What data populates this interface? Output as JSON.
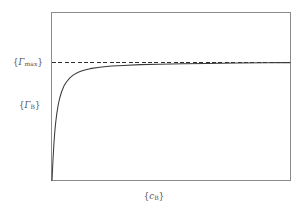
{
  "figure": {
    "name": "langmuir-adsorption-isotherm",
    "background_color": "#ffffff",
    "frame_color": "#8b8b8b",
    "curve_color": "#3a3a3a",
    "dashed_color": "#2e2e2e",
    "text_color": "#4f4f4f"
  },
  "labels": {
    "y_asymptote": "{Γmax}",
    "y_asymptote_open": "{",
    "y_asymptote_symbol": "Γ",
    "y_asymptote_sub": "max",
    "y_asymptote_close": "}",
    "y_axis": "{ΓB}",
    "y_axis_open": "{",
    "y_axis_symbol": "Γ",
    "y_axis_sub": "B",
    "y_axis_close": "}",
    "x_axis": "{cB}",
    "x_axis_open": "{",
    "x_axis_symbol": "c",
    "x_axis_sub": "B",
    "x_axis_close": "}"
  },
  "chart_data": {
    "type": "line",
    "title": "",
    "xlabel": "{c_B}",
    "ylabel": "{Γ_B}",
    "grid": false,
    "legend": false,
    "xlim": [
      0,
      1
    ],
    "ylim": [
      0,
      1.12
    ],
    "annotations": [
      {
        "name": "gamma-max-asymptote",
        "type": "horizontal-dashed-line",
        "y": 1.0,
        "label": "{Γmax}",
        "style": "dashed",
        "color": "#2e2e2e"
      }
    ],
    "series": [
      {
        "name": "langmuir-isotherm",
        "style": "solid",
        "color": "#3a3a3a",
        "description": "Gamma_B = Gamma_max * K*c / (1 + K*c), saturating curve rising from origin to asymptote",
        "x": [
          0.0,
          0.004,
          0.008,
          0.012,
          0.016,
          0.02,
          0.026,
          0.032,
          0.04,
          0.05,
          0.06,
          0.075,
          0.09,
          0.11,
          0.13,
          0.16,
          0.2,
          0.25,
          0.3,
          0.37,
          0.45,
          0.55,
          0.65,
          0.78,
          0.9,
          1.0
        ],
        "y": [
          0.0,
          0.17,
          0.31,
          0.42,
          0.5,
          0.565,
          0.64,
          0.695,
          0.75,
          0.8,
          0.833,
          0.87,
          0.895,
          0.918,
          0.932,
          0.948,
          0.96,
          0.97,
          0.975,
          0.982,
          0.986,
          0.99,
          0.992,
          0.995,
          0.997,
          0.999
        ]
      }
    ]
  }
}
